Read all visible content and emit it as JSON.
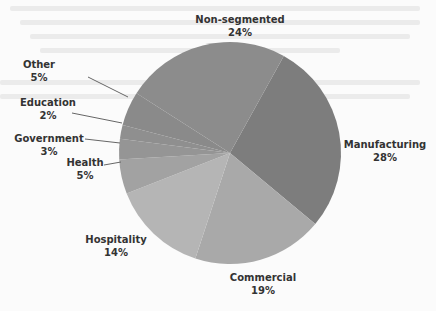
{
  "chart_data": {
    "type": "pie",
    "title": "",
    "start_angle_deg_clockwise_from_top": 29,
    "direction": "clockwise",
    "slices": [
      {
        "label": "Manufacturing",
        "value": 28,
        "display": "28%",
        "color": "#7d7d7d"
      },
      {
        "label": "Commercial",
        "value": 19,
        "display": "19%",
        "color": "#a9a9a9"
      },
      {
        "label": "Hospitality",
        "value": 14,
        "display": "14%",
        "color": "#b5b5b5"
      },
      {
        "label": "Health",
        "value": 5,
        "display": "5%",
        "color": "#a2a2a2"
      },
      {
        "label": "Government",
        "value": 3,
        "display": "3%",
        "color": "#959595"
      },
      {
        "label": "Education",
        "value": 2,
        "display": "2%",
        "color": "#8f8f8f"
      },
      {
        "label": "Other",
        "value": 5,
        "display": "5%",
        "color": "#8a8a8a"
      },
      {
        "label": "Non-segmented",
        "value": 24,
        "display": "24%",
        "color": "#8c8c8c"
      }
    ],
    "legend": "none (direct labels with leader lines)"
  },
  "labels": {
    "manufacturing": {
      "name": "Manufacturing",
      "pct": "28%"
    },
    "commercial": {
      "name": "Commercial",
      "pct": "19%"
    },
    "hospitality": {
      "name": "Hospitality",
      "pct": "14%"
    },
    "health": {
      "name": "Health",
      "pct": "5%"
    },
    "government": {
      "name": "Government",
      "pct": "3%"
    },
    "education": {
      "name": "Education",
      "pct": "2%"
    },
    "other": {
      "name": "Other",
      "pct": "5%"
    },
    "nonsegmented": {
      "name": "Non-segmented",
      "pct": "24%"
    }
  }
}
